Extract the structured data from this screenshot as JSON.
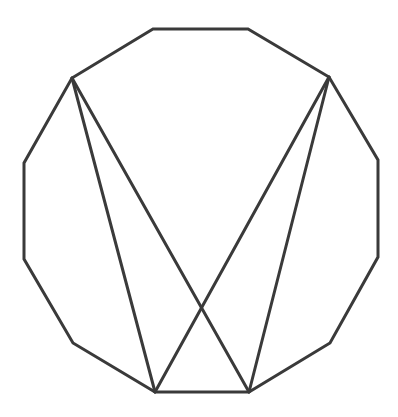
{
  "diagram": {
    "shape": "regular-dodecagon",
    "stroke_color": "#3a3a3a",
    "stroke_width": 3,
    "background": "#ffffff",
    "vertices": [
      {
        "name": "top-left",
        "x": 153,
        "y": 29
      },
      {
        "name": "top-right",
        "x": 248,
        "y": 29
      },
      {
        "name": "upper-right",
        "x": 329,
        "y": 77
      },
      {
        "name": "right-top",
        "x": 378,
        "y": 160
      },
      {
        "name": "right-bottom",
        "x": 378,
        "y": 257
      },
      {
        "name": "lower-right",
        "x": 330,
        "y": 343
      },
      {
        "name": "bottom-right",
        "x": 249,
        "y": 392
      },
      {
        "name": "bottom-left",
        "x": 155,
        "y": 392
      },
      {
        "name": "lower-left",
        "x": 73,
        "y": 343
      },
      {
        "name": "left-bottom",
        "x": 24,
        "y": 259
      },
      {
        "name": "left-top",
        "x": 24,
        "y": 163
      },
      {
        "name": "upper-left",
        "x": 72,
        "y": 78
      }
    ],
    "diagonals": [
      {
        "from": "upper-left",
        "to": "bottom-left",
        "x1": 72,
        "y1": 78,
        "x2": 155,
        "y2": 392
      },
      {
        "from": "upper-left",
        "to": "bottom-right",
        "x1": 72,
        "y1": 78,
        "x2": 249,
        "y2": 392
      },
      {
        "from": "upper-right",
        "to": "bottom-left",
        "x1": 329,
        "y1": 77,
        "x2": 155,
        "y2": 392
      },
      {
        "from": "upper-right",
        "to": "bottom-right",
        "x1": 329,
        "y1": 77,
        "x2": 249,
        "y2": 392
      }
    ],
    "intersection": {
      "x": 202,
      "y": 304
    }
  }
}
